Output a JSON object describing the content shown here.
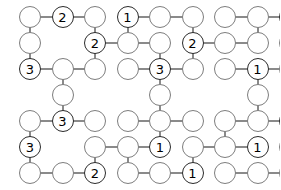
{
  "puzzle": {
    "type": "number-link-grid",
    "columns": 9,
    "rows": 7,
    "cell_width": 32.5,
    "cell_height": 26,
    "origin_x": 30,
    "origin_y": 17,
    "node_diameter": 22,
    "colors": {
      "background": "#ffffff",
      "node_stroke": "#7d7d7d",
      "node_stroke_filled": "#2b2b2b",
      "node_fill": "#ffffff",
      "edge": "#8a8a8a",
      "label": "#000000"
    },
    "nodes": [
      {
        "row": 0,
        "col": 0,
        "label": ""
      },
      {
        "row": 0,
        "col": 1,
        "label": "2"
      },
      {
        "row": 0,
        "col": 2,
        "label": ""
      },
      {
        "row": 0,
        "col": 3,
        "label": "1"
      },
      {
        "row": 0,
        "col": 4,
        "label": ""
      },
      {
        "row": 0,
        "col": 5,
        "label": ""
      },
      {
        "row": 0,
        "col": 6,
        "label": ""
      },
      {
        "row": 0,
        "col": 7,
        "label": ""
      },
      {
        "row": 0,
        "col": 8,
        "label": "1"
      },
      {
        "row": 1,
        "col": 0,
        "label": ""
      },
      {
        "row": 1,
        "col": 2,
        "label": "2"
      },
      {
        "row": 1,
        "col": 3,
        "label": ""
      },
      {
        "row": 1,
        "col": 4,
        "label": ""
      },
      {
        "row": 1,
        "col": 5,
        "label": "2"
      },
      {
        "row": 1,
        "col": 6,
        "label": ""
      },
      {
        "row": 1,
        "col": 7,
        "label": ""
      },
      {
        "row": 1,
        "col": 8,
        "label": ""
      },
      {
        "row": 2,
        "col": 0,
        "label": "3"
      },
      {
        "row": 2,
        "col": 1,
        "label": ""
      },
      {
        "row": 2,
        "col": 2,
        "label": ""
      },
      {
        "row": 2,
        "col": 3,
        "label": ""
      },
      {
        "row": 2,
        "col": 4,
        "label": "3"
      },
      {
        "row": 2,
        "col": 5,
        "label": ""
      },
      {
        "row": 2,
        "col": 6,
        "label": ""
      },
      {
        "row": 2,
        "col": 7,
        "label": "1"
      },
      {
        "row": 2,
        "col": 8,
        "label": ""
      },
      {
        "row": 3,
        "col": 1,
        "label": ""
      },
      {
        "row": 3,
        "col": 4,
        "label": ""
      },
      {
        "row": 3,
        "col": 7,
        "label": ""
      },
      {
        "row": 4,
        "col": 0,
        "label": ""
      },
      {
        "row": 4,
        "col": 1,
        "label": "3"
      },
      {
        "row": 4,
        "col": 2,
        "label": ""
      },
      {
        "row": 4,
        "col": 3,
        "label": ""
      },
      {
        "row": 4,
        "col": 4,
        "label": ""
      },
      {
        "row": 4,
        "col": 5,
        "label": ""
      },
      {
        "row": 4,
        "col": 6,
        "label": ""
      },
      {
        "row": 4,
        "col": 7,
        "label": ""
      },
      {
        "row": 4,
        "col": 8,
        "label": "1"
      },
      {
        "row": 5,
        "col": 0,
        "label": "3"
      },
      {
        "row": 5,
        "col": 2,
        "label": ""
      },
      {
        "row": 5,
        "col": 3,
        "label": ""
      },
      {
        "row": 5,
        "col": 4,
        "label": "1"
      },
      {
        "row": 5,
        "col": 5,
        "label": ""
      },
      {
        "row": 5,
        "col": 6,
        "label": ""
      },
      {
        "row": 5,
        "col": 7,
        "label": "1"
      },
      {
        "row": 5,
        "col": 8,
        "label": ""
      },
      {
        "row": 6,
        "col": 0,
        "label": ""
      },
      {
        "row": 6,
        "col": 1,
        "label": ""
      },
      {
        "row": 6,
        "col": 2,
        "label": "2"
      },
      {
        "row": 6,
        "col": 3,
        "label": ""
      },
      {
        "row": 6,
        "col": 4,
        "label": ""
      },
      {
        "row": 6,
        "col": 5,
        "label": "1"
      },
      {
        "row": 6,
        "col": 6,
        "label": ""
      },
      {
        "row": 6,
        "col": 7,
        "label": ""
      },
      {
        "row": 6,
        "col": 8,
        "label": ""
      }
    ],
    "edges": [
      {
        "orientation": "h",
        "row": 0,
        "col": 0
      },
      {
        "orientation": "h",
        "row": 0,
        "col": 1
      },
      {
        "orientation": "h",
        "row": 0,
        "col": 3
      },
      {
        "orientation": "h",
        "row": 0,
        "col": 4
      },
      {
        "orientation": "h",
        "row": 0,
        "col": 6
      },
      {
        "orientation": "h",
        "row": 0,
        "col": 7
      },
      {
        "orientation": "h",
        "row": 1,
        "col": 2
      },
      {
        "orientation": "h",
        "row": 1,
        "col": 3
      },
      {
        "orientation": "h",
        "row": 1,
        "col": 5
      },
      {
        "orientation": "h",
        "row": 1,
        "col": 6
      },
      {
        "orientation": "h",
        "row": 2,
        "col": 0
      },
      {
        "orientation": "h",
        "row": 2,
        "col": 1
      },
      {
        "orientation": "h",
        "row": 2,
        "col": 3
      },
      {
        "orientation": "h",
        "row": 2,
        "col": 4
      },
      {
        "orientation": "h",
        "row": 2,
        "col": 6
      },
      {
        "orientation": "h",
        "row": 2,
        "col": 7
      },
      {
        "orientation": "h",
        "row": 4,
        "col": 0
      },
      {
        "orientation": "h",
        "row": 4,
        "col": 1
      },
      {
        "orientation": "h",
        "row": 4,
        "col": 3
      },
      {
        "orientation": "h",
        "row": 4,
        "col": 4
      },
      {
        "orientation": "h",
        "row": 4,
        "col": 6
      },
      {
        "orientation": "h",
        "row": 4,
        "col": 7
      },
      {
        "orientation": "h",
        "row": 5,
        "col": 2
      },
      {
        "orientation": "h",
        "row": 5,
        "col": 3
      },
      {
        "orientation": "h",
        "row": 5,
        "col": 5
      },
      {
        "orientation": "h",
        "row": 5,
        "col": 6
      },
      {
        "orientation": "h",
        "row": 6,
        "col": 0
      },
      {
        "orientation": "h",
        "row": 6,
        "col": 1
      },
      {
        "orientation": "h",
        "row": 6,
        "col": 3
      },
      {
        "orientation": "h",
        "row": 6,
        "col": 4
      },
      {
        "orientation": "h",
        "row": 6,
        "col": 6
      },
      {
        "orientation": "h",
        "row": 6,
        "col": 7
      },
      {
        "orientation": "v",
        "row": 0,
        "col": 0
      },
      {
        "orientation": "v",
        "row": 1,
        "col": 0
      },
      {
        "orientation": "v",
        "row": 4,
        "col": 0
      },
      {
        "orientation": "v",
        "row": 5,
        "col": 0
      },
      {
        "orientation": "v",
        "row": 2,
        "col": 1
      },
      {
        "orientation": "v",
        "row": 3,
        "col": 1
      },
      {
        "orientation": "v",
        "row": 5,
        "col": 2
      },
      {
        "orientation": "v",
        "row": 0,
        "col": 2
      },
      {
        "orientation": "v",
        "row": 1,
        "col": 2
      },
      {
        "orientation": "v",
        "row": 0,
        "col": 3
      },
      {
        "orientation": "v",
        "row": 5,
        "col": 3
      },
      {
        "orientation": "v",
        "row": 1,
        "col": 4
      },
      {
        "orientation": "v",
        "row": 2,
        "col": 4
      },
      {
        "orientation": "v",
        "row": 3,
        "col": 4
      },
      {
        "orientation": "v",
        "row": 4,
        "col": 4
      },
      {
        "orientation": "v",
        "row": 0,
        "col": 5
      },
      {
        "orientation": "v",
        "row": 1,
        "col": 5
      },
      {
        "orientation": "v",
        "row": 5,
        "col": 5
      },
      {
        "orientation": "v",
        "row": 4,
        "col": 6
      },
      {
        "orientation": "v",
        "row": 2,
        "col": 7
      },
      {
        "orientation": "v",
        "row": 3,
        "col": 7
      },
      {
        "orientation": "v",
        "row": 0,
        "col": 7
      },
      {
        "orientation": "v",
        "row": 0,
        "col": 8
      },
      {
        "orientation": "v",
        "row": 1,
        "col": 8
      },
      {
        "orientation": "v",
        "row": 4,
        "col": 8
      },
      {
        "orientation": "v",
        "row": 5,
        "col": 8
      }
    ]
  }
}
